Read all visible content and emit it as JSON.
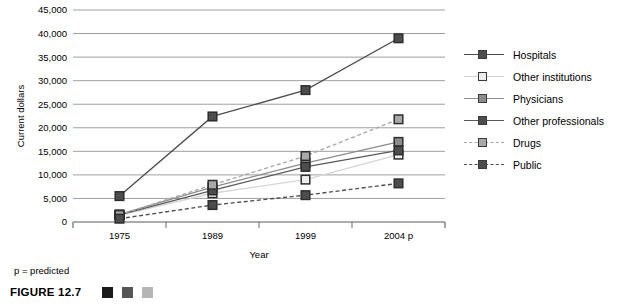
{
  "figure": {
    "caption_label": "FIGURE 12.7",
    "predicted_note": "p = predicted",
    "caption_swatches": [
      "#1a1a1a",
      "#555555",
      "#b5b5b5"
    ]
  },
  "legend": {
    "position": "right",
    "items": [
      {
        "label": "Hospitals",
        "color": "#4d4d4d",
        "dash": "solid",
        "marker_fill": "#4d4d4d"
      },
      {
        "label": "Other institutions",
        "color": "#d6d6d6",
        "dash": "solid",
        "marker_fill": "#ededed"
      },
      {
        "label": "Physicians",
        "color": "#8c8c8c",
        "dash": "solid",
        "marker_fill": "#8c8c8c"
      },
      {
        "label": "Other professionals",
        "color": "#5a5a5a",
        "dash": "solid",
        "marker_fill": "#4d4d4d"
      },
      {
        "label": "Drugs",
        "color": "#a8a8a8",
        "dash": "dashed",
        "marker_fill": "#a8a8a8"
      },
      {
        "label": "Public",
        "color": "#4d4d4d",
        "dash": "dashed",
        "marker_fill": "#4d4d4d"
      }
    ]
  },
  "chart_data": {
    "type": "line",
    "title": "",
    "xlabel": "Year",
    "ylabel": "Current dollars",
    "categories": [
      "1975",
      "1989",
      "1999",
      "2004 p"
    ],
    "ylim": [
      0,
      45000
    ],
    "ytick_step": 5000,
    "ytick_labels": [
      "0",
      "5,000",
      "10,000",
      "15,000",
      "20,000",
      "25,000",
      "30,000",
      "35,000",
      "40,000",
      "45,000"
    ],
    "ytick_values": [
      0,
      5000,
      10000,
      15000,
      20000,
      25000,
      30000,
      35000,
      40000,
      45000
    ],
    "grid": true,
    "series": [
      {
        "name": "Hospitals",
        "values": [
          5500,
          22400,
          28000,
          39000
        ],
        "color": "#4d4d4d",
        "dash": "solid",
        "marker_fill": "#4d4d4d"
      },
      {
        "name": "Other institutions",
        "values": [
          1400,
          6100,
          9000,
          14300
        ],
        "color": "#d6d6d6",
        "dash": "solid",
        "marker_fill": "#ededed"
      },
      {
        "name": "Physicians",
        "values": [
          1600,
          7400,
          12500,
          17000
        ],
        "color": "#8c8c8c",
        "dash": "solid",
        "marker_fill": "#8c8c8c"
      },
      {
        "name": "Other professionals",
        "values": [
          1500,
          6700,
          11700,
          15200
        ],
        "color": "#5a5a5a",
        "dash": "solid",
        "marker_fill": "#4d4d4d"
      },
      {
        "name": "Drugs",
        "values": [
          1500,
          7900,
          14000,
          21800
        ],
        "color": "#a8a8a8",
        "dash": "dashed",
        "marker_fill": "#a8a8a8"
      },
      {
        "name": "Public",
        "values": [
          700,
          3600,
          5700,
          8200
        ],
        "color": "#4d4d4d",
        "dash": "dashed",
        "marker_fill": "#4d4d4d"
      }
    ]
  }
}
